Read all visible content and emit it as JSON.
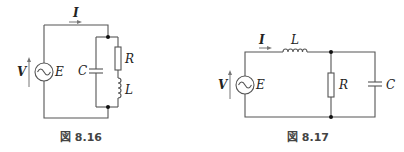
{
  "figures": [
    {
      "id": "fig-8-16",
      "caption": "図 8.16",
      "labels": {
        "current": "I",
        "voltage": "V",
        "source": "E",
        "capacitor": "C",
        "resistor": "R",
        "inductor": "L"
      },
      "topology": "Source E in series with parallel combination of C and (R series L)"
    },
    {
      "id": "fig-8-17",
      "caption": "図 8.17",
      "labels": {
        "current": "I",
        "voltage": "V",
        "source": "E",
        "inductor": "L",
        "resistor": "R",
        "capacitor": "C"
      },
      "topology": "Source E in series with L, feeding parallel R and C"
    }
  ],
  "colors": {
    "wire": "#555555",
    "text": "#222222",
    "node": "#111111",
    "background": "#ffffff"
  }
}
